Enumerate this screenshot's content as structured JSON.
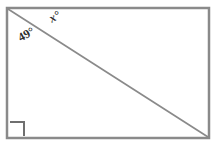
{
  "figure": {
    "type": "geometry-diagram",
    "shape": "rectangle",
    "colors": {
      "background": "#ffffff",
      "border": "#8a8a8a",
      "diagonal": "#8a8a8a",
      "label_text": "#2b2b2b",
      "right_angle_marker": "#6f6f6f"
    },
    "rectangle": {
      "left": 7,
      "top": 8,
      "right": 209,
      "bottom": 138,
      "stroke_width": 2.5
    },
    "diagonal": {
      "from": "top-left",
      "to": "bottom-right",
      "x1": 8,
      "y1": 9,
      "x2": 208,
      "y2": 137,
      "stroke_width": 1.6
    },
    "right_angle_marker": {
      "corner": "bottom-left",
      "x": 10,
      "y": 122,
      "size": 14,
      "stroke_width": 2
    },
    "labels": [
      {
        "id": "x-angle",
        "text": "x°",
        "style": "italic-bold",
        "rotation_deg": -29,
        "position": "above the diagonal near the top-left corner"
      },
      {
        "id": "angle-49",
        "text": "49°",
        "style": "bold",
        "rotation_deg": -29,
        "position": "below the diagonal near the top-left corner"
      }
    ]
  }
}
